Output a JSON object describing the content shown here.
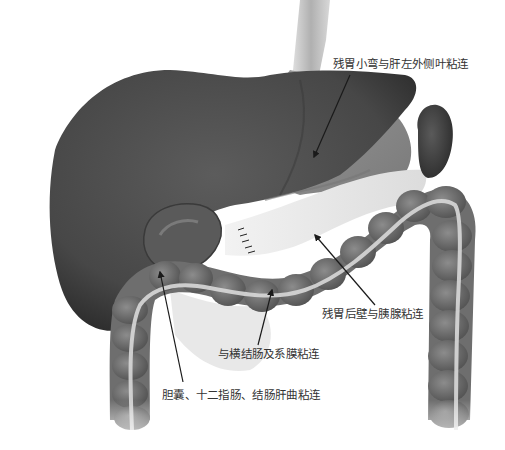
{
  "diagram": {
    "type": "anatomical-illustration",
    "structures": [
      {
        "id": "liver",
        "name": "liver",
        "shade": "#4a4a4a"
      },
      {
        "id": "gallbladder",
        "name": "gallbladder",
        "shade": "#5a5a5a"
      },
      {
        "id": "remnant-stomach",
        "name": "remnant stomach",
        "shade": "#8a8a8a"
      },
      {
        "id": "esophagus",
        "name": "esophagus",
        "shade": "#b5b5b5"
      },
      {
        "id": "pancreas",
        "name": "pancreas",
        "shade": "#e8e8e8"
      },
      {
        "id": "spleen",
        "name": "spleen",
        "shade": "#3e3e3e"
      },
      {
        "id": "colon",
        "name": "colon",
        "shade": "#6e6e6e"
      }
    ],
    "labels": [
      {
        "id": "label-1",
        "text": "残胃小弯与肝左外侧叶粘连"
      },
      {
        "id": "label-2",
        "text": "残胃后壁与胰腺粘连"
      },
      {
        "id": "label-3",
        "text": "与横结肠及系膜粘连"
      },
      {
        "id": "label-4",
        "text": "胆囊、十二指肠、结肠肝曲粘连"
      }
    ],
    "colors": {
      "background": "#ffffff",
      "text": "#333333",
      "arrow": "#1a1a1a"
    }
  }
}
